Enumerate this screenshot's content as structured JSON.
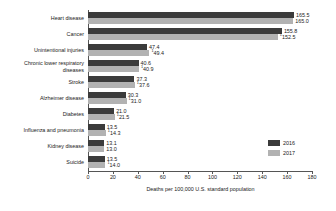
{
  "chart_data": {
    "type": "bar",
    "orientation": "horizontal",
    "title": "",
    "xlabel": "Deaths per 100,000 U.S. standard population",
    "ylabel": "",
    "xlim": [
      0,
      180
    ],
    "xticks": [
      0,
      20,
      40,
      60,
      80,
      100,
      120,
      140,
      160,
      180
    ],
    "xtick_labels": [
      "0",
      "20",
      "40",
      "60",
      "80",
      "100",
      "120",
      "140",
      "160",
      "180"
    ],
    "grid": false,
    "legend_position": "bottom-right",
    "categories": [
      "Heart disease",
      "Cancer",
      "Unintentional injuries",
      "Chronic lower respiratory\ndiseases",
      "Stroke",
      "Alzheimer disease",
      "Diabetes",
      "Influenza and pneumonia",
      "Kidney disease",
      "Suicide"
    ],
    "series": [
      {
        "name": "2016",
        "color": "#3b3b3b",
        "values": [
          165.5,
          155.8,
          47.4,
          40.6,
          37.3,
          30.3,
          21.0,
          13.5,
          13.1,
          13.5
        ],
        "labels": [
          "165.5",
          "155.8",
          "47.4",
          "40.6",
          "37.3",
          "30.3",
          "21.0",
          "13.5",
          "13.1",
          "13.5"
        ]
      },
      {
        "name": "2017",
        "color": "#b2b2b2",
        "values": [
          165.0,
          152.5,
          49.4,
          40.9,
          37.6,
          31.0,
          21.5,
          14.3,
          13.0,
          14.0
        ],
        "labels": [
          "165.0",
          "152.5",
          "49.4",
          "40.9",
          "37.6",
          "31.0",
          "21.5",
          "14.3",
          "13.0",
          "14.0"
        ],
        "label_superscripts": [
          "",
          "1",
          "1",
          "1",
          "1",
          "1",
          "1",
          "1",
          "",
          "1"
        ]
      }
    ]
  },
  "legend": {
    "items": [
      {
        "label": "2016",
        "color": "#3b3b3b"
      },
      {
        "label": "2017",
        "color": "#b2b2b2"
      }
    ]
  },
  "axis": {
    "x_title": "Deaths per 100,000 U.S. standard population"
  }
}
